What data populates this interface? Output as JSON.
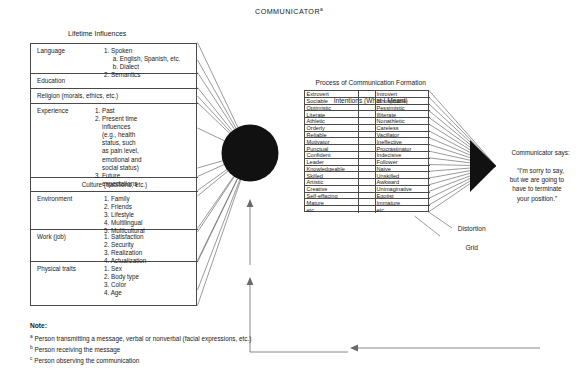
{
  "title": {
    "text": "COMMUNICATOR",
    "superscript": "a"
  },
  "left_panel": {
    "heading": "Lifetime Influences",
    "rows": [
      {
        "name": "Language",
        "items": "1. Spoken\n     a. English, Spanish, etc.\n     b. Dialect\n2. Semantics",
        "center": false
      },
      {
        "name": "Education",
        "items": "",
        "center": false
      },
      {
        "name": "Religion (morals, ethics, etc.)",
        "items": "",
        "center": false
      },
      {
        "name": "Experience",
        "items": "1. Past\n2. Present time\n    influences\n    (e.g., health\n    status, such\n    as pain level,\n    emotional and\n    social status)\n3. Future\n    expectations",
        "center": false
      },
      {
        "name": "Culture (traditions, etc.)",
        "items": "",
        "center": true
      },
      {
        "name": "Environment",
        "items": "1. Family\n2. Friends\n3. Lifestyle\n4. Multilingual\n5. Multicultural",
        "center": false
      },
      {
        "name": "Work (job)",
        "items": "1. Satisfaction\n2. Security\n3. Realization\n4. Actualization",
        "center": false
      },
      {
        "name": "Physical traits",
        "items": "1. Sex\n2. Body type\n3. Color\n4. Age",
        "center": false
      }
    ]
  },
  "center_panel": {
    "heading_line1": "Process of Communication Formation",
    "heading_line2": "Intentions (What I Meant)",
    "trait_pairs": [
      {
        "positive": "Extrovert",
        "negative": "Introvert"
      },
      {
        "positive": "Sociable",
        "negative": "Inhospitable"
      },
      {
        "positive": "Optimistic",
        "negative": "Pessimistic"
      },
      {
        "positive": "Literate",
        "negative": "Illiterate"
      },
      {
        "positive": "Athletic",
        "negative": "Nonathletic"
      },
      {
        "positive": "Orderly",
        "negative": "Careless"
      },
      {
        "positive": "Reliable",
        "negative": "Vacillator"
      },
      {
        "positive": "Motivator",
        "negative": "Ineffective"
      },
      {
        "positive": "Punctual",
        "negative": "Procrastinator"
      },
      {
        "positive": "Confident",
        "negative": "Indecisive"
      },
      {
        "positive": "Leader",
        "negative": "Follower"
      },
      {
        "positive": "Knowledgeable",
        "negative": "Naive"
      },
      {
        "positive": "Skilled",
        "negative": "Unskilled"
      },
      {
        "positive": "Artistic",
        "negative": "Awkward"
      },
      {
        "positive": "Creative",
        "negative": "Unimaginative"
      },
      {
        "positive": "Self-effacing",
        "negative": "Egotist"
      },
      {
        "positive": "Mature",
        "negative": "Immature"
      },
      {
        "positive": "etc.",
        "negative": "etc."
      }
    ]
  },
  "distortion": {
    "line1": "Distortion",
    "line2": "Grid"
  },
  "communicator_says": {
    "lead": "Communicator says:",
    "quote": "“I’m sorry to say,\nbut we are going to\nhave to terminate\nyour position.”"
  },
  "notes": {
    "title": "Note:",
    "a_marker": "a",
    "a_text": " Person transmitting a message, verbal or nonverbal (facial expressions, etc.)",
    "b_marker": "b",
    "b_text": " Person receiving the message",
    "c_marker": "c",
    "c_text": " Person observing the communication"
  },
  "colors": {
    "line": "#4a4a4a",
    "fan": "#565656",
    "node": "#111111",
    "text": "#1a1a1a",
    "background": "#ffffff"
  }
}
